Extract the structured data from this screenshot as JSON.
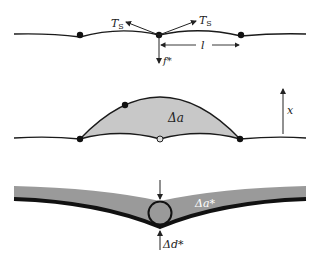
{
  "diagram": {
    "panel_top": {
      "tension_left_label": "T",
      "tension_left_sub": "S",
      "tension_right_label": "T",
      "tension_right_sub": "S",
      "spacing_label": "l",
      "force_label": "f*"
    },
    "panel_middle": {
      "area_label": "Δa",
      "displacement_label": "x"
    },
    "panel_bottom": {
      "area_label": "Δa*",
      "depth_label": "Δd*"
    },
    "colors": {
      "line": "#1a1a1a",
      "fill_light": "#c8c8c8",
      "fill_band": "#9a9a9a",
      "band_edge": "#111111"
    }
  }
}
